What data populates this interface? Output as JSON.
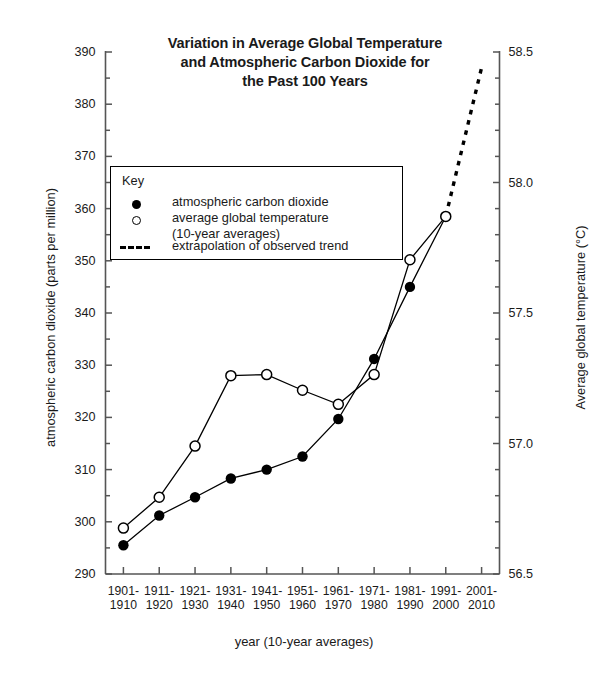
{
  "chart_data": {
    "type": "line",
    "title": "Variation in Average Global Temperature and Atmospheric Carbon Dioxide for the Past 100 Years",
    "title_lines": [
      "Variation in Average Global Temperature",
      "and Atmospheric Carbon Dioxide for",
      "the Past 100 Years"
    ],
    "xlabel": "year (10-year averages)",
    "ylabel": "atmospheric carbon dioxide (parts per million)",
    "ylabel_right": "Average global temperature (°C)",
    "categories": [
      "1901-1910",
      "1911-1920",
      "1921-1930",
      "1931-1940",
      "1941-1950",
      "1951-1960",
      "1961-1970",
      "1971-1980",
      "1981-1990",
      "1991-2000",
      "2001-2010"
    ],
    "category_lines": [
      [
        "1901-",
        "1910"
      ],
      [
        "1911-",
        "1920"
      ],
      [
        "1921-",
        "1930"
      ],
      [
        "1931-",
        "1940"
      ],
      [
        "1941-",
        "1950"
      ],
      [
        "1951-",
        "1960"
      ],
      [
        "1961-",
        "1970"
      ],
      [
        "1971-",
        "1980"
      ],
      [
        "1981-",
        "1990"
      ],
      [
        "1991-",
        "2000"
      ],
      [
        "2001-",
        "2010"
      ]
    ],
    "ylim": [
      290,
      390
    ],
    "yticks": [
      290,
      300,
      310,
      320,
      330,
      340,
      350,
      360,
      370,
      380,
      390
    ],
    "yminor_step": 5,
    "ylim_right": [
      56.5,
      58.5
    ],
    "yticks_right": [
      56.5,
      57.0,
      57.5,
      58.0,
      58.5
    ],
    "ytick_right_labels": [
      "56.5",
      "57.0",
      "57.5",
      "58.0",
      "58.5"
    ],
    "yminor_step_right": 0.1,
    "grid": false,
    "legend_position": "inside-upper-left",
    "series": [
      {
        "name": "atmospheric carbon dioxide",
        "marker": "filled-circle",
        "axis": "left",
        "values": [
          295.5,
          301.2,
          304.7,
          308.3,
          310.0,
          312.5,
          319.7,
          331.2,
          345.0,
          358.5,
          null
        ]
      },
      {
        "name": "average global temperature (10-year averages)",
        "marker": "open-circle",
        "axis": "right",
        "values_ppm_scale": [
          298.8,
          304.7,
          314.5,
          328.0,
          328.2,
          325.2,
          322.5,
          328.2,
          350.2,
          358.5,
          null
        ],
        "values_celsius": [
          56.67,
          56.79,
          56.98,
          57.26,
          57.26,
          57.2,
          57.15,
          57.26,
          57.7,
          57.87,
          null
        ]
      },
      {
        "name": "extrapolation of observed trend",
        "marker": "none",
        "line": "dashed",
        "axis": "left",
        "values": [
          null,
          null,
          null,
          null,
          null,
          null,
          null,
          null,
          null,
          358.5,
          387.0
        ],
        "values_celsius": [
          null,
          null,
          null,
          null,
          null,
          null,
          null,
          null,
          null,
          57.87,
          58.44
        ]
      }
    ]
  },
  "legend": {
    "title": "Key",
    "items": [
      {
        "symbol": "filled-circle",
        "label": "atmospheric carbon dioxide"
      },
      {
        "symbol": "open-circle",
        "label_line1": "average global temperature",
        "label_line2": "(10-year averages)"
      },
      {
        "symbol": "dashed-line",
        "label": "extrapolation of observed trend"
      }
    ]
  },
  "colors": {
    "ink": "#1a1a1a",
    "axis": "#555555",
    "line": "#000000",
    "background": "#ffffff"
  }
}
